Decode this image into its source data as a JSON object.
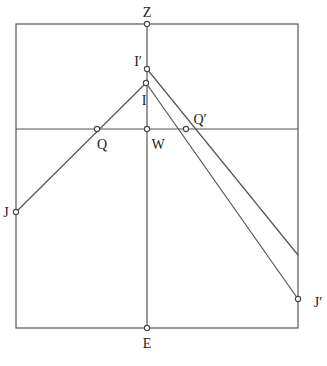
{
  "diagram": {
    "frame": {
      "x1": 16,
      "y1": 24,
      "x2": 298,
      "y2": 328
    },
    "horizon_y": 129,
    "vertical_x": 147,
    "points": {
      "Z": {
        "label": "Z",
        "x": 147,
        "y": 24,
        "lx": 147,
        "ly": 17,
        "anchor": "middle"
      },
      "Ip": {
        "label": "I′",
        "x": 147,
        "y": 69,
        "lx": 138,
        "ly": 66,
        "anchor": "middle"
      },
      "I": {
        "label": "I",
        "x": 146,
        "y": 83,
        "lx": 144,
        "ly": 105,
        "anchor": "middle"
      },
      "Q": {
        "label": "Q",
        "x": 97,
        "y": 129,
        "lx": 102,
        "ly": 149,
        "anchor": "middle"
      },
      "W": {
        "label": "W",
        "x": 147,
        "y": 129,
        "lx": 158,
        "ly": 149,
        "anchor": "middle"
      },
      "Qp": {
        "label": "Q′",
        "x": 186,
        "y": 129,
        "lx": 200,
        "ly": 124,
        "anchor": "middle"
      },
      "J": {
        "label": "J",
        "x": 16,
        "y": 212,
        "lx": 6,
        "ly": 217,
        "anchor": "middle"
      },
      "Jp": {
        "label": "J′",
        "x": 298,
        "y": 299,
        "lx": 318,
        "ly": 307,
        "anchor": "middle"
      },
      "E": {
        "label": "E",
        "x": 147,
        "y": 328,
        "lx": 147,
        "ly": 348,
        "anchor": "middle"
      }
    },
    "segments": [
      {
        "from": [
          16,
          212
        ],
        "to": [
          146,
          83
        ]
      },
      {
        "from": [
          146,
          83
        ],
        "to": [
          298,
          299
        ]
      },
      {
        "from": [
          147,
          69
        ],
        "to": [
          298,
          255
        ]
      }
    ]
  }
}
